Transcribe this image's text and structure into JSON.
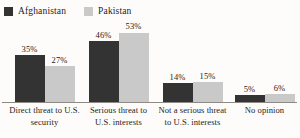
{
  "legend": {
    "entries": [
      {
        "label": "Afghanistan",
        "color": "#333333",
        "swatch_icon": "legend-swatch-square"
      },
      {
        "label": "Pakistan",
        "color": "#c9c9c9",
        "swatch_icon": "legend-swatch-square"
      }
    ]
  },
  "chart_data": {
    "type": "bar",
    "title": "",
    "subtitle": "",
    "xlabel": "",
    "ylabel": "",
    "ylim": [
      0,
      60
    ],
    "grid": false,
    "legend_position": "top-left",
    "value_label_suffix": "%",
    "categories": [
      "Direct threat to U.S. security",
      "Serious threat to U.S. interests",
      "Not a serious threat to U.S. interests",
      "No opinion"
    ],
    "category_lines": [
      [
        "Direct threat to U.S.",
        "security"
      ],
      [
        "Serious threat to",
        "U.S. interests"
      ],
      [
        "Not a serious threat",
        "to U.S. interests"
      ],
      [
        "No opinion"
      ]
    ],
    "series": [
      {
        "name": "Afghanistan",
        "color": "#333333",
        "values": [
          35,
          46,
          14,
          5
        ],
        "labels": [
          "35%",
          "46%",
          "14%",
          "5%"
        ]
      },
      {
        "name": "Pakistan",
        "color": "#c9c9c9",
        "values": [
          27,
          53,
          15,
          6
        ],
        "labels": [
          "27%",
          "53%",
          "15%",
          "6%"
        ]
      }
    ]
  }
}
